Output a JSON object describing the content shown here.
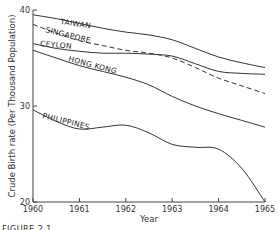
{
  "figure_caption": "FIGURE 2.1",
  "chart_data": {
    "type": "line",
    "title": "",
    "xlabel": "Year",
    "ylabel": "Crude Birth rate (Per Thousand Population)",
    "xlim": [
      1960,
      1965
    ],
    "ylim": [
      20,
      40
    ],
    "x_ticks": [
      "1960",
      "1961",
      "1962",
      "1963",
      "1964",
      "1965"
    ],
    "y_ticks": [
      "20",
      "30",
      "40"
    ],
    "grid": false,
    "legend": "inline labels",
    "x": [
      1960,
      1960.5,
      1961,
      1961.5,
      1962,
      1962.5,
      1963,
      1963.5,
      1964,
      1964.5,
      1965
    ],
    "series": [
      {
        "name": "TAIWAN",
        "style": "solid",
        "values": [
          39.5,
          39.1,
          38.6,
          38.1,
          37.7,
          37.4,
          36.9,
          36.0,
          35.1,
          34.5,
          34.0
        ]
      },
      {
        "name": "SINGAPORE",
        "style": "dashed",
        "values": [
          38.5,
          37.6,
          36.8,
          36.3,
          35.8,
          35.5,
          35.0,
          34.0,
          32.9,
          32.1,
          31.3
        ]
      },
      {
        "name": "CEYLON",
        "style": "solid",
        "values": [
          36.5,
          36.0,
          35.7,
          35.5,
          35.5,
          35.4,
          35.2,
          34.4,
          33.6,
          33.4,
          33.3
        ]
      },
      {
        "name": "HONG KONG",
        "style": "solid",
        "values": [
          35.8,
          35.0,
          34.2,
          33.6,
          33.0,
          32.2,
          31.0,
          30.0,
          29.2,
          28.5,
          27.8
        ]
      },
      {
        "name": "PHILIPPINES",
        "style": "solid",
        "values": [
          29.6,
          28.4,
          27.6,
          27.8,
          28.0,
          27.2,
          26.0,
          25.7,
          25.5,
          23.5,
          20.0
        ]
      }
    ]
  }
}
